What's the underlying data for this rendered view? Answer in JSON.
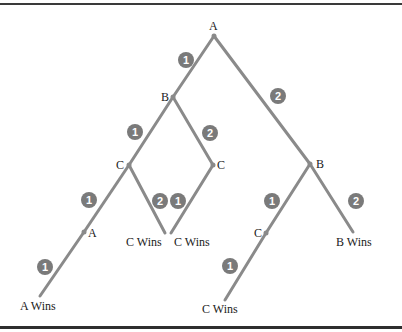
{
  "diagram": {
    "type": "game-tree",
    "colors": {
      "edge": "#8a8a8a",
      "badge": "#7a7a7a",
      "badge_text": "#ffffff",
      "node_text": "#1a1a1a"
    },
    "nodes": {
      "root": {
        "label": "A",
        "x": 214,
        "y": 36
      },
      "b1": {
        "label": "B",
        "x": 173,
        "y": 97
      },
      "b2": {
        "label": "B",
        "x": 310,
        "y": 164
      },
      "c1": {
        "label": "C",
        "x": 129,
        "y": 165
      },
      "c2": {
        "label": "C",
        "x": 213,
        "y": 165
      },
      "a2": {
        "label": "A",
        "x": 84,
        "y": 232
      },
      "c3": {
        "label": "C",
        "x": 266,
        "y": 233
      }
    },
    "leaves": {
      "leaf1": {
        "label": "A Wins"
      },
      "leaf2": {
        "label": "C Wins"
      },
      "leaf3": {
        "label": "C Wins"
      },
      "leaf4": {
        "label": "C Wins"
      },
      "leaf5": {
        "label": "B Wins"
      }
    },
    "edges": [
      {
        "from": "root",
        "to": "b1",
        "badge": "1"
      },
      {
        "from": "root",
        "to": "b2",
        "badge": "2"
      },
      {
        "from": "b1",
        "to": "c1",
        "badge": "1"
      },
      {
        "from": "b1",
        "to": "c2",
        "badge": "2"
      },
      {
        "from": "c1",
        "to": "a2",
        "badge": "1"
      },
      {
        "from": "c1",
        "to": "leaf2",
        "badge": "2"
      },
      {
        "from": "c2",
        "to": "leaf3",
        "badge": "1"
      },
      {
        "from": "a2",
        "to": "leaf1",
        "badge": "1"
      },
      {
        "from": "b2",
        "to": "c3",
        "badge": "1"
      },
      {
        "from": "b2",
        "to": "leaf5",
        "badge": "2"
      },
      {
        "from": "c3",
        "to": "leaf4",
        "badge": "1"
      }
    ]
  }
}
